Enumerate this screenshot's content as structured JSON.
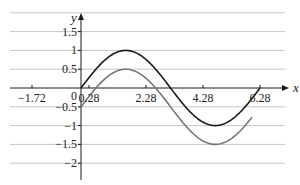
{
  "chart_data": {
    "type": "line",
    "title": "",
    "xlabel": "x",
    "ylabel": "y",
    "xlim": [
      -2.5,
      7.0
    ],
    "ylim": [
      -2.25,
      1.9
    ],
    "grid": {
      "horizontal": true,
      "vertical": false
    },
    "x_ticks": [
      -1.72,
      0.28,
      2.28,
      4.28,
      6.28
    ],
    "x_tick_labels": [
      "−1.72",
      "0.28",
      "2.28",
      "4.28",
      "6.28"
    ],
    "y_ticks": [
      1.5,
      1,
      0.5,
      -0.5,
      -1,
      -1.5,
      -2
    ],
    "y_tick_labels": [
      "1.5",
      "1",
      "0.5",
      "−0.5",
      "−1",
      "−1.5",
      "−2"
    ],
    "origin_label": "0",
    "series": [
      {
        "name": "y = sin x",
        "color": "#1a1a1a",
        "x_range": [
          0,
          6.28
        ],
        "x": [
          0,
          0.785,
          1.571,
          2.356,
          3.142,
          3.927,
          4.712,
          5.498,
          6.283
        ],
        "values": [
          0,
          0.71,
          1,
          0.71,
          0,
          -0.71,
          -1,
          -0.71,
          0
        ]
      },
      {
        "name": "y = sin x − 0.5",
        "color": "#777777",
        "x_range": [
          0,
          6.0
        ],
        "x": [
          0,
          0.785,
          1.571,
          2.356,
          3.142,
          3.927,
          4.712,
          5.498,
          6.0
        ],
        "values": [
          -0.5,
          0.21,
          0.5,
          0.21,
          -0.5,
          -1.21,
          -1.5,
          -1.21,
          -0.78
        ]
      }
    ]
  },
  "layout": {
    "origin_px": [
      81,
      88
    ],
    "x_px_per_unit": 28.5,
    "y_px_per_unit": 37.6
  }
}
